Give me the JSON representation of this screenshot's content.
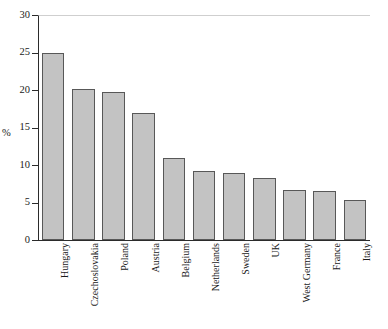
{
  "chart_data": {
    "type": "bar",
    "title": "",
    "subtitle": "",
    "xlabel": "",
    "ylabel": "%",
    "ylim": [
      0,
      30
    ],
    "yticks": [
      0,
      5,
      10,
      15,
      20,
      25,
      30
    ],
    "ytick_labels": [
      "0",
      "5",
      "10",
      "15",
      "20",
      "25",
      "30"
    ],
    "grid": false,
    "legend": false,
    "bar_fill_color": "#c3c3c3",
    "bar_edge_color": "#585858",
    "axis_color": "#2b2b2b",
    "categories": [
      "Hungary",
      "Czechoslovakia",
      "Poland",
      "Austria",
      "Belgium",
      "Netherlands",
      "Sweden",
      "UK",
      "West Germany",
      "France",
      "Italy"
    ],
    "values": [
      25.0,
      20.1,
      19.7,
      16.9,
      10.9,
      9.2,
      8.9,
      8.3,
      6.7,
      6.6,
      5.3
    ]
  }
}
